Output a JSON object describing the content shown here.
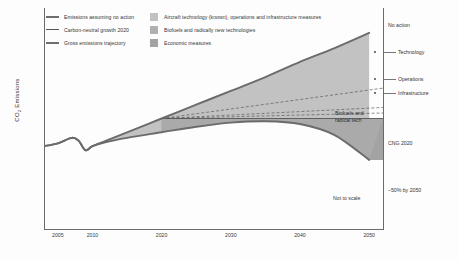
{
  "chart_data": {
    "type": "area",
    "title": "",
    "xlabel": "",
    "ylabel": "CO2 Emissions",
    "ylabel_main": "CO",
    "ylabel_sub": "2",
    "ylabel_rest": " Emissions",
    "note": "Not to scale",
    "xlim": [
      2003,
      2052
    ],
    "xticks": [
      2005,
      2010,
      2020,
      2030,
      2040,
      2050
    ],
    "xticklabels": [
      "2005",
      "2010",
      "2020",
      "2030",
      "2040",
      "2050"
    ],
    "grid": false,
    "legend_position": "top-left",
    "series": [
      {
        "name": "Emissions assuming no action",
        "style": "thick-line",
        "x": [
          2003,
          2005,
          2007,
          2008,
          2009,
          2010,
          2012,
          2015,
          2020,
          2025,
          2030,
          2035,
          2040,
          2045,
          2050
        ],
        "y": [
          60,
          62,
          66,
          64,
          57,
          60,
          64,
          70,
          80,
          90,
          100,
          110,
          121,
          131,
          142
        ]
      },
      {
        "name": "Carbon-neutral growth 2020",
        "style": "thin-line",
        "x": [
          2020,
          2050
        ],
        "y": [
          80,
          80
        ]
      },
      {
        "name": "Gross emissions trajectory",
        "style": "thick-line",
        "x": [
          2003,
          2005,
          2007,
          2008,
          2009,
          2010,
          2012,
          2015,
          2020,
          2025,
          2030,
          2035,
          2040,
          2045,
          2050
        ],
        "y": [
          60,
          62,
          66,
          64,
          57,
          60,
          63,
          66,
          70,
          74,
          77,
          78,
          76,
          68,
          50
        ]
      }
    ],
    "wedges": [
      {
        "name": "Aircraft technology (known), operations and infrastructure measures",
        "color": "#c2c2c2"
      },
      {
        "name": "Biofuels and radically new technologies",
        "color": "#b0b0b0"
      },
      {
        "name": "Economic measures",
        "color": "#a3a3a3"
      }
    ],
    "dashed_lines": [
      {
        "name": "Technology",
        "end_y": 102
      },
      {
        "name": "Operations",
        "end_y": 88
      },
      {
        "name": "Infrastructure",
        "end_y": 84
      }
    ],
    "right_labels": [
      {
        "label": "No action",
        "y": 22,
        "tick": false,
        "dot": false
      },
      {
        "label": "Technology",
        "y": 49,
        "tick": true,
        "dot": true
      },
      {
        "label": "Operations",
        "y": 76,
        "tick": true,
        "dot": true
      },
      {
        "label": "Infrastructure",
        "y": 90,
        "tick": true,
        "dot": true
      },
      {
        "label": "CNG 2020",
        "y": 140,
        "tick": false,
        "dot": false
      },
      {
        "label": "–50% by 2050",
        "y": 187,
        "tick": false,
        "dot": false
      }
    ],
    "inner_labels": [
      {
        "line1": "Biofuels and",
        "line2": "radical tech"
      }
    ]
  },
  "legend": {
    "lines": [
      {
        "label": "Emissions assuming no action",
        "weight": "thick"
      },
      {
        "label": "Carbon-neutral growth 2020",
        "weight": "thin"
      },
      {
        "label": "Gross emissions trajectory",
        "weight": "thick"
      }
    ],
    "swatches": [
      {
        "label": "Aircraft technology (known), operations and infrastructure measures",
        "color": "#c2c2c2"
      },
      {
        "label": "Biofuels and radically new technologies",
        "color": "#b0b0b0"
      },
      {
        "label": "Economic measures",
        "color": "#a3a3a3"
      }
    ]
  }
}
